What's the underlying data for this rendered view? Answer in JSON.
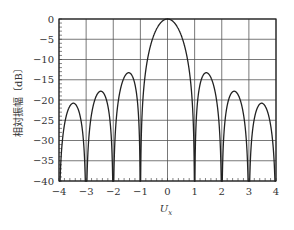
{
  "chart_data": {
    "type": "line",
    "title": "",
    "xlabel": "U_x",
    "xlabel_main": "U",
    "xlabel_sub": "x",
    "ylabel": "相対振幅〔dB〕",
    "xlim": [
      -4,
      4
    ],
    "ylim": [
      -40,
      0
    ],
    "grid": true,
    "legend": null,
    "x_ticks": [
      -4,
      -3,
      -2,
      -1,
      0,
      1,
      2,
      3,
      4
    ],
    "x_tick_labels": [
      "−4",
      "−3",
      "−2",
      "−1",
      "0",
      "1",
      "2",
      "3",
      "4"
    ],
    "y_ticks": [
      0,
      -5,
      -10,
      -15,
      -20,
      -25,
      -30,
      -35,
      -40
    ],
    "y_tick_labels": [
      "0",
      "−5",
      "−10",
      "−15",
      "−20",
      "−25",
      "−30",
      "−35",
      "−40"
    ],
    "series": [
      {
        "name": "20log10|sin(πU)/(πU)|",
        "function": "sinc_db",
        "floor_db": -40,
        "main_lobe": {
          "x": 0,
          "y": 0
        },
        "nulls_x": [
          -3,
          -2,
          -1,
          1,
          2,
          3
        ],
        "side_lobe_peaks": [
          {
            "x": -3.47,
            "y": -20.8
          },
          {
            "x": -2.46,
            "y": -17.8
          },
          {
            "x": -1.43,
            "y": -13.3
          },
          {
            "x": 1.43,
            "y": -13.3
          },
          {
            "x": 2.46,
            "y": -17.8
          },
          {
            "x": 3.47,
            "y": -20.8
          }
        ],
        "color": "#222222"
      }
    ]
  }
}
